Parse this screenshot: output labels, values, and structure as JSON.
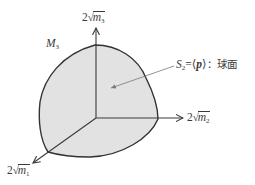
{
  "diagram": {
    "type": "3d-axes-spherical-patch",
    "region_label": {
      "base": "M",
      "sub": "3"
    },
    "axes": {
      "vertical": {
        "coefficient": "2",
        "radical": "√",
        "var": "m",
        "sub": "3"
      },
      "horizontal": {
        "coefficient": "2",
        "radical": "√",
        "var": "m",
        "sub": "2"
      },
      "diagonal": {
        "coefficient": "2",
        "radical": "√",
        "var": "m",
        "sub": "1"
      }
    },
    "surface_annotation": {
      "symbol": "S",
      "sub": "2",
      "equals": "=",
      "open": "⟨",
      "vector": "p",
      "close": "⟩",
      "colon": "：",
      "description": "球面"
    },
    "colors": {
      "fill": "#e2e2e2",
      "stroke": "#333333",
      "axis": "#3a3a3a",
      "leader": "#777777"
    }
  }
}
